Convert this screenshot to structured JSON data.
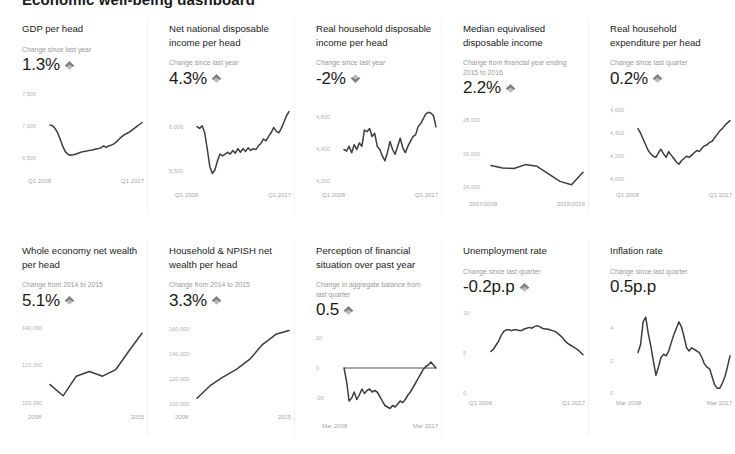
{
  "page": {
    "heading": "Economic well-being dashboard"
  },
  "colors": {
    "line": "#3d3d3d",
    "arrow": "#808080",
    "title": "#1b1b1b",
    "muted": "#9a9a9a",
    "tick": "#b3b3b3",
    "background": "#ffffff"
  },
  "cards": [
    {
      "id": "gdp-per-head",
      "title": "GDP per head",
      "change_label": "Change since last year",
      "value": "1.3%",
      "direction": "up",
      "chart_data": {
        "type": "line",
        "title": "GDP per head",
        "xlabel": "",
        "ylabel": "",
        "ylim": [
          6300,
          7600
        ],
        "yticks": [
          7500,
          7000,
          6500
        ],
        "ytick_labels": [
          "7,500",
          "7,000",
          "6,500"
        ],
        "xticks": [
          "Q1 2008",
          "Q1 2017"
        ],
        "grid": false,
        "legend": "none",
        "x": [
          0,
          1,
          2,
          3,
          4,
          5,
          6,
          7,
          8,
          9,
          10,
          11,
          12,
          13,
          14,
          15,
          16,
          17,
          18,
          19,
          20,
          21,
          22,
          23,
          24,
          25,
          26,
          27,
          28,
          29,
          30,
          31,
          32,
          33,
          34,
          35,
          36
        ],
        "values": [
          7010,
          7000,
          6960,
          6890,
          6790,
          6680,
          6600,
          6560,
          6545,
          6550,
          6560,
          6575,
          6590,
          6600,
          6605,
          6615,
          6620,
          6630,
          6640,
          6650,
          6660,
          6690,
          6665,
          6690,
          6700,
          6720,
          6750,
          6790,
          6830,
          6860,
          6880,
          6900,
          6930,
          6960,
          6990,
          7020,
          7050
        ]
      }
    },
    {
      "id": "net-national-disposable-income-per-head",
      "title": "Net national disposable income per head",
      "change_label": "Change since last year",
      "value": "4.3%",
      "direction": "up",
      "chart_data": {
        "type": "line",
        "title": "Net national disposable income per head",
        "xlabel": "",
        "ylabel": "",
        "ylim": [
          5350,
          6300
        ],
        "yticks": [
          6500,
          6000,
          5500
        ],
        "ytick_labels": [
          "6,500",
          "6,000",
          "5,500"
        ],
        "xticks": [
          "Q1 2008",
          "Q1 2017"
        ],
        "grid": false,
        "legend": "none",
        "x": [
          0,
          1,
          2,
          3,
          4,
          5,
          6,
          7,
          8,
          9,
          10,
          11,
          12,
          13,
          14,
          15,
          16,
          17,
          18,
          19,
          20,
          21,
          22,
          23,
          24,
          25,
          26,
          27,
          28,
          29,
          30,
          31,
          32,
          33,
          34,
          35,
          36
        ],
        "values": [
          6010,
          5990,
          6020,
          5940,
          5760,
          5560,
          5480,
          5520,
          5620,
          5700,
          5680,
          5700,
          5720,
          5700,
          5740,
          5710,
          5760,
          5720,
          5760,
          5730,
          5770,
          5740,
          5760,
          5750,
          5790,
          5820,
          5870,
          5850,
          5900,
          5940,
          6000,
          5960,
          5940,
          5990,
          6060,
          6130,
          6180
        ]
      }
    },
    {
      "id": "real-household-disposable-income-per-head",
      "title": "Real household disposable income per head",
      "change_label": "Change since last year",
      "value": "-2%",
      "direction": "down",
      "chart_data": {
        "type": "line",
        "title": "Real household disposable income per head",
        "xlabel": "",
        "ylabel": "",
        "ylim": [
          4180,
          4700
        ],
        "yticks": [
          4800,
          4600,
          4400,
          4200
        ],
        "ytick_labels": [
          "4,800",
          "4,600",
          "4,400",
          "4,200"
        ],
        "xticks": [
          "Q1 2008",
          "Q1 2017"
        ],
        "grid": false,
        "legend": "none",
        "x": [
          0,
          1,
          2,
          3,
          4,
          5,
          6,
          7,
          8,
          9,
          10,
          11,
          12,
          13,
          14,
          15,
          16,
          17,
          18,
          19,
          20,
          21,
          22,
          23,
          24,
          25,
          26,
          27,
          28,
          29,
          30,
          31,
          32,
          33,
          34,
          35,
          36
        ],
        "values": [
          4400,
          4390,
          4420,
          4380,
          4430,
          4400,
          4440,
          4420,
          4520,
          4510,
          4530,
          4480,
          4500,
          4420,
          4400,
          4360,
          4330,
          4380,
          4450,
          4400,
          4370,
          4420,
          4470,
          4410,
          4380,
          4420,
          4450,
          4480,
          4490,
          4540,
          4560,
          4590,
          4620,
          4630,
          4625,
          4610,
          4540
        ]
      }
    },
    {
      "id": "median-equivalised-disposable-income",
      "title": "Median equivalised disposable income",
      "change_label": "Change from financial year ending 2015 to 2016",
      "value": "2.2%",
      "direction": "up",
      "chart_data": {
        "type": "line",
        "title": "Median equivalised disposable income",
        "xlabel": "",
        "ylabel": "",
        "ylim": [
          23600,
          28600
        ],
        "yticks": [
          28000,
          26000,
          24000
        ],
        "ytick_labels": [
          "28,000",
          "26,000",
          "24,000"
        ],
        "xticks": [
          "2007/2008",
          "2015/2016"
        ],
        "grid": false,
        "legend": "none",
        "x": [
          0,
          1,
          2,
          3,
          4,
          5,
          6,
          7,
          8
        ],
        "values": [
          25300,
          25150,
          25120,
          25350,
          25250,
          24800,
          24350,
          24150,
          24900
        ]
      }
    },
    {
      "id": "real-household-expenditure-per-head",
      "title": "Real household expenditure per head",
      "change_label": "Change since last quarter",
      "value": "0.2%",
      "direction": "up",
      "chart_data": {
        "type": "line",
        "title": "Real household expenditure per head",
        "xlabel": "",
        "ylabel": "",
        "ylim": [
          3950,
          4680
        ],
        "yticks": [
          4600,
          4400,
          4200,
          4000
        ],
        "ytick_labels": [
          "4,600",
          "4,400",
          "4,200",
          "4,000"
        ],
        "xticks": [
          "Q1 2008",
          "Q1 2017"
        ],
        "grid": false,
        "legend": "none",
        "x": [
          0,
          1,
          2,
          3,
          4,
          5,
          6,
          7,
          8,
          9,
          10,
          11,
          12,
          13,
          14,
          15,
          16,
          17,
          18,
          19,
          20,
          21,
          22,
          23,
          24,
          25,
          26,
          27,
          28,
          29,
          30,
          31,
          32,
          33,
          34,
          35,
          36
        ],
        "values": [
          4440,
          4400,
          4350,
          4300,
          4250,
          4220,
          4200,
          4190,
          4230,
          4260,
          4220,
          4190,
          4240,
          4210,
          4180,
          4150,
          4130,
          4160,
          4180,
          4200,
          4190,
          4210,
          4230,
          4250,
          4240,
          4270,
          4290,
          4300,
          4320,
          4330,
          4360,
          4390,
          4420,
          4440,
          4470,
          4490,
          4510
        ]
      }
    },
    {
      "id": "whole-economy-net-wealth-per-head",
      "title": "Whole economy net wealth per head",
      "change_label": "Change from 2014 to 2015",
      "value": "5.1%",
      "direction": "up",
      "chart_data": {
        "type": "line",
        "title": "Whole economy net wealth per head",
        "xlabel": "",
        "ylabel": "",
        "ylim": [
          98000,
          143000
        ],
        "yticks": [
          140000,
          120000,
          100000
        ],
        "ytick_labels": [
          "140,000",
          "120,000",
          "100,000"
        ],
        "xticks": [
          "2008",
          "2015"
        ],
        "grid": false,
        "legend": "none",
        "x": [
          2008,
          2009,
          2010,
          2011,
          2012,
          2013,
          2014,
          2015
        ],
        "values": [
          110000,
          104000,
          114500,
          117000,
          114500,
          118000,
          128000,
          137500
        ]
      }
    },
    {
      "id": "household-npish-net-wealth-per-head",
      "title": "Household & NPISH net wealth per head",
      "change_label": "Change from 2014 to 2015",
      "value": "3.3%",
      "direction": "up",
      "chart_data": {
        "type": "line",
        "title": "Household & NPISH net wealth per head",
        "xlabel": "",
        "ylabel": "",
        "ylim": [
          98000,
          165000
        ],
        "yticks": [
          160000,
          140000,
          120000,
          100000
        ],
        "ytick_labels": [
          "160,000",
          "140,000",
          "120,000",
          "100,000"
        ],
        "xticks": [
          "2008",
          "2015"
        ],
        "grid": false,
        "legend": "none",
        "x": [
          2008,
          2009,
          2010,
          2011,
          2012,
          2013,
          2014,
          2015
        ],
        "values": [
          105000,
          115000,
          122000,
          128000,
          136000,
          148000,
          156000,
          159000
        ]
      }
    },
    {
      "id": "perception-of-financial-situation-over-past-year",
      "title": "Perception of financial situation over past year",
      "change_label": "Change in aggregate balance from last quarter",
      "value": "0.5",
      "direction": "up",
      "chart_data": {
        "type": "line",
        "title": "Perception of financial situation over past year",
        "xlabel": "",
        "ylabel": "",
        "ylim": [
          -32,
          24
        ],
        "yticks": [
          20,
          0,
          -20
        ],
        "ytick_labels": [
          "20",
          "0",
          "-20"
        ],
        "xticks": [
          "Mar 2008",
          "Mar 2017"
        ],
        "grid": false,
        "zero_line": 0,
        "legend": "none",
        "x": [
          0,
          1,
          2,
          3,
          4,
          5,
          6,
          7,
          8,
          9,
          10,
          11,
          12,
          13,
          14,
          15,
          16,
          17,
          18,
          19,
          20,
          21,
          22,
          23,
          24,
          25,
          26,
          27,
          28,
          29,
          30,
          31,
          32,
          33,
          34,
          35,
          36
        ],
        "values": [
          0,
          -9,
          -22,
          -20,
          -16,
          -21,
          -18,
          -14,
          -17,
          -15,
          -14,
          -16,
          -15,
          -16,
          -19,
          -22,
          -25,
          -26,
          -27,
          -25,
          -26,
          -24,
          -22,
          -23,
          -21,
          -18,
          -16,
          -13,
          -10,
          -7,
          -4,
          -1,
          1,
          2,
          4,
          2,
          0
        ]
      }
    },
    {
      "id": "unemployment-rate",
      "title": "Unemployment rate",
      "change_label": "Change since last quarter",
      "value": "-0.2p.p",
      "direction": "up",
      "chart_data": {
        "type": "line",
        "title": "Unemployment rate",
        "xlabel": "",
        "ylabel": "",
        "ylim": [
          0,
          10.5
        ],
        "yticks": [
          10,
          5,
          0
        ],
        "ytick_labels": [
          "10",
          "5",
          "0"
        ],
        "xticks": [
          "Q1 2008",
          "Q1 2017"
        ],
        "grid": false,
        "legend": "none",
        "x": [
          0,
          1,
          2,
          3,
          4,
          5,
          6,
          7,
          8,
          9,
          10,
          11,
          12,
          13,
          14,
          15,
          16,
          17,
          18,
          19,
          20,
          21,
          22,
          23,
          24,
          25,
          26,
          27,
          28,
          29,
          30,
          31,
          32,
          33,
          34,
          35,
          36
        ],
        "values": [
          5.2,
          5.5,
          6.0,
          6.5,
          7.2,
          7.7,
          7.9,
          7.9,
          7.8,
          7.9,
          7.9,
          7.8,
          7.8,
          8.0,
          8.1,
          8.2,
          8.1,
          8.3,
          8.4,
          8.3,
          8.1,
          8.0,
          8.0,
          7.9,
          7.8,
          7.7,
          7.5,
          7.2,
          6.9,
          6.5,
          6.2,
          6.0,
          5.8,
          5.6,
          5.4,
          5.1,
          4.8
        ]
      }
    },
    {
      "id": "inflation-rate",
      "title": "Inflation rate",
      "change_label": "Change since last quarter",
      "value": "0.5p.p",
      "direction": "none",
      "chart_data": {
        "type": "line",
        "title": "Inflation rate",
        "xlabel": "",
        "ylabel": "",
        "ylim": [
          0,
          5.2
        ],
        "yticks": [
          4,
          2,
          0
        ],
        "ytick_labels": [
          "4",
          "2",
          "0"
        ],
        "xticks": [
          "Mar 2008",
          "Mar 2017"
        ],
        "grid": false,
        "legend": "none",
        "x": [
          0,
          1,
          2,
          3,
          4,
          5,
          6,
          7,
          8,
          9,
          10,
          11,
          12,
          13,
          14,
          15,
          16,
          17,
          18,
          19,
          20,
          21,
          22,
          23,
          24,
          25,
          26,
          27,
          28,
          29,
          30,
          31,
          32,
          33,
          34,
          35,
          36
        ],
        "values": [
          2.5,
          3.0,
          4.4,
          4.7,
          3.7,
          2.9,
          2.0,
          1.1,
          1.6,
          2.2,
          2.4,
          2.3,
          2.6,
          3.1,
          3.6,
          4.0,
          4.4,
          4.1,
          3.5,
          2.8,
          2.6,
          2.8,
          2.7,
          2.6,
          2.5,
          2.2,
          1.8,
          1.6,
          1.5,
          1.0,
          0.5,
          0.3,
          0.3,
          0.6,
          1.0,
          1.6,
          2.3
        ]
      }
    }
  ]
}
